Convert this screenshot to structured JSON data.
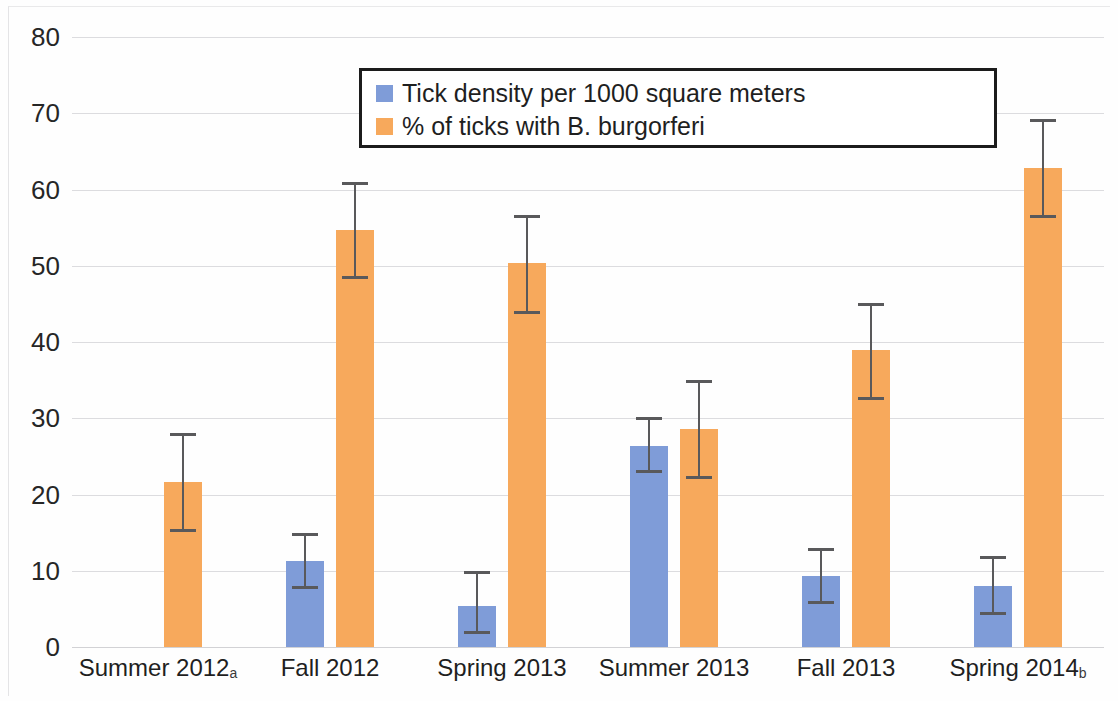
{
  "chart_data": {
    "type": "bar",
    "title": "",
    "xlabel": "",
    "ylabel": "",
    "ylim": [
      0,
      80
    ],
    "yticks": [
      0,
      10,
      20,
      30,
      40,
      50,
      60,
      70,
      80
    ],
    "grid": true,
    "legend_position": "top-center",
    "categories": [
      "Summer 2012",
      "Fall 2012",
      "Spring 2013",
      "Summer 2013",
      "Fall 2013",
      "Spring 2014"
    ],
    "category_footnotes": [
      "a",
      "",
      "",
      "",
      "",
      "b"
    ],
    "category_labels": [
      "Summer 2012a",
      "Fall 2012",
      "Spring 2013",
      "Summer 2013",
      "Fall 2013",
      "Spring 2014b"
    ],
    "series": [
      {
        "name": "Tick density per 1000 square meters",
        "color": "#7f9cd8",
        "values": [
          null,
          11.3,
          5.4,
          26.4,
          9.3,
          8.0
        ],
        "error_low": [
          null,
          7.6,
          1.7,
          22.8,
          5.6,
          4.2
        ],
        "error_high": [
          null,
          14.9,
          10.0,
          30.1,
          13.0,
          11.9
        ]
      },
      {
        "name": "% of ticks with B. burgorferi",
        "color": "#f7a95c",
        "values": [
          21.6,
          54.7,
          50.3,
          28.6,
          38.9,
          62.8
        ],
        "error_low": [
          15.1,
          48.2,
          43.7,
          22.0,
          32.4,
          56.3
        ],
        "error_high": [
          28.1,
          61.0,
          56.7,
          35.0,
          45.1,
          69.3
        ]
      }
    ]
  },
  "legend": {
    "items": [
      {
        "label": "Tick density per 1000 square meters",
        "color": "#7f9cd8"
      },
      {
        "label": "% of ticks with B. burgorferi",
        "color": "#f7a95c"
      }
    ]
  },
  "axis": {
    "y_tick_labels": [
      "80",
      "70",
      "60",
      "50",
      "40",
      "30",
      "20",
      "10",
      "0"
    ]
  },
  "colors": {
    "series_blue": "#7f9cd8",
    "series_orange": "#f7a95c",
    "gridline": "#dcdcdf",
    "error_bar": "#59595b",
    "text": "#1f1f1f",
    "legend_border": "#1c1c1c",
    "background": "#ffffff"
  }
}
